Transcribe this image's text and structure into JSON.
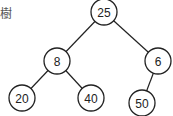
{
  "title_fragment": "樹",
  "tree": {
    "nodes": [
      {
        "id": "n25",
        "value": "25",
        "x": 104,
        "y": 12
      },
      {
        "id": "n8",
        "value": "8",
        "x": 57,
        "y": 61
      },
      {
        "id": "n6",
        "value": "6",
        "x": 158,
        "y": 61
      },
      {
        "id": "n20",
        "value": "20",
        "x": 22,
        "y": 98
      },
      {
        "id": "n40",
        "value": "40",
        "x": 91,
        "y": 98
      },
      {
        "id": "n50",
        "value": "50",
        "x": 142,
        "y": 103
      }
    ],
    "edges": [
      [
        "n25",
        "n8"
      ],
      [
        "n25",
        "n6"
      ],
      [
        "n8",
        "n20"
      ],
      [
        "n8",
        "n40"
      ],
      [
        "n6",
        "n50"
      ]
    ],
    "radius": 13
  }
}
